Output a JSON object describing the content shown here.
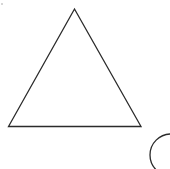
{
  "canvas": {
    "width": 170,
    "height": 169,
    "background_color": "#ffffff"
  },
  "figure": {
    "stroke_color": "#2b2b2b",
    "stroke_width": 1.3,
    "fill": "none"
  },
  "shapes": [
    {
      "name": "triangle",
      "kind": "triangle",
      "label": "Triangle",
      "points": "74.5,9 141,126.5 8.5,126.5",
      "vertices": [
        {
          "name": "apex",
          "x": 74.5,
          "y": 9
        },
        {
          "name": "bottom-right",
          "x": 141,
          "y": 126.5
        },
        {
          "name": "bottom-left",
          "x": 8.5,
          "y": 126.5
        }
      ],
      "base_width": 132.5,
      "height": 117.5
    },
    {
      "name": "circle",
      "kind": "circle",
      "label": "Circle (clipped at corner)",
      "center_x": 171,
      "center_y": 155,
      "radius": 21,
      "clipped": "right and bottom edges"
    }
  ],
  "artifacts": [
    {
      "name": "speck",
      "x": 1,
      "y": 3,
      "color": "#c9c9c9"
    }
  ]
}
